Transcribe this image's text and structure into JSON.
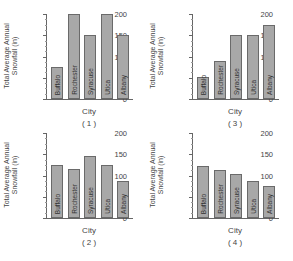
{
  "chart_data": [
    {
      "type": "bar",
      "title": "(1)",
      "xlabel": "City",
      "ylabel": "Total Average Annual Snowfall (in)",
      "categories": [
        "Buffalo",
        "Rochester",
        "Syracuse",
        "Utica",
        "Albany"
      ],
      "values": [
        75,
        200,
        150,
        200,
        150
      ],
      "ylim": [
        0,
        200
      ],
      "yticks": [
        0,
        50,
        100,
        150,
        200
      ],
      "grid": false,
      "bar_color": "#a8a8a8"
    },
    {
      "type": "bar",
      "title": "(3)",
      "xlabel": "City",
      "ylabel": "Total Average Annual Snowfall (in)",
      "categories": [
        "Buffalo",
        "Rochester",
        "Syracuse",
        "Utica",
        "Albany"
      ],
      "values": [
        52,
        90,
        150,
        150,
        175
      ],
      "ylim": [
        0,
        200
      ],
      "yticks": [
        0,
        50,
        100,
        150,
        200
      ],
      "grid": false,
      "bar_color": "#a8a8a8"
    },
    {
      "type": "bar",
      "title": "(2)",
      "xlabel": "City",
      "ylabel": "Total Average Annual Snowfall (in)",
      "categories": [
        "Buffalo",
        "Rochester",
        "Syracuse",
        "Utica",
        "Albany"
      ],
      "values": [
        125,
        115,
        145,
        125,
        87
      ],
      "ylim": [
        0,
        200
      ],
      "yticks": [
        0,
        50,
        100,
        150,
        200
      ],
      "grid": false,
      "bar_color": "#a8a8a8"
    },
    {
      "type": "bar",
      "title": "(4)",
      "xlabel": "City",
      "ylabel": "Total Average Annual Snowfall (in)",
      "categories": [
        "Buffalo",
        "Rochester",
        "Syracuse",
        "Utica",
        "Albany"
      ],
      "values": [
        123,
        113,
        103,
        87,
        75
      ],
      "ylim": [
        0,
        200
      ],
      "yticks": [
        0,
        50,
        100,
        150,
        200
      ],
      "grid": false,
      "bar_color": "#a8a8a8"
    }
  ],
  "panels": [
    {
      "caption": "( 1 )",
      "xlabel": "City",
      "ylabel": "Total Average Annual Snowfall (in)"
    },
    {
      "caption": "( 3 )",
      "xlabel": "City",
      "ylabel": "Total Average Annual Snowfall (in)"
    },
    {
      "caption": "( 2 )",
      "xlabel": "City",
      "ylabel": "Total Average Annual Snowfall (in)"
    },
    {
      "caption": "( 4 )",
      "xlabel": "City",
      "ylabel": "Total Average Annual Snowfall (in)"
    }
  ]
}
